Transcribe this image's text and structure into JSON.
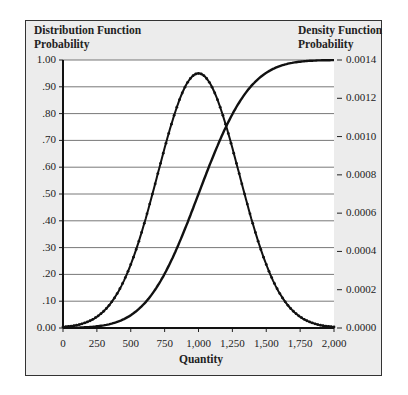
{
  "chart_data": {
    "type": "line",
    "title_left": [
      "Distribution Function",
      "Probability"
    ],
    "title_right": [
      "Density Function",
      "Probability"
    ],
    "xlabel": "Quantity",
    "x_ticks": [
      "0",
      "250",
      "500",
      "750",
      "1,000",
      "1,250",
      "1,500",
      "1,750",
      "2,000"
    ],
    "x_tick_values": [
      0,
      250,
      500,
      750,
      1000,
      1250,
      1500,
      1750,
      2000
    ],
    "xlim": [
      0,
      2000
    ],
    "y_left_ticks": [
      "0.00",
      ".10",
      ".20",
      ".30",
      ".40",
      ".50",
      ".60",
      ".70",
      ".80",
      ".90",
      "1.00"
    ],
    "y_left_lim": [
      0,
      1
    ],
    "y_right_ticks": [
      "0.0000",
      "0.0002",
      "0.0004",
      "0.0006",
      "0.0008",
      "0.0010",
      "0.0012",
      "0.0014"
    ],
    "y_right_lim": [
      0,
      0.0014
    ],
    "grid": "horizontal",
    "distribution": {
      "type": "normal",
      "mean": 1000,
      "std": 300
    },
    "series": [
      {
        "name": "Distribution Function (CDF)",
        "axis": "left",
        "x": [
          0,
          100,
          200,
          300,
          400,
          500,
          600,
          700,
          800,
          900,
          1000,
          1100,
          1200,
          1300,
          1400,
          1500,
          1600,
          1700,
          1800,
          1900,
          2000
        ],
        "values": [
          0.0004,
          0.0013,
          0.0038,
          0.0098,
          0.0228,
          0.0478,
          0.0912,
          0.1587,
          0.2525,
          0.3694,
          0.5,
          0.6306,
          0.7475,
          0.8413,
          0.9088,
          0.9522,
          0.9772,
          0.9902,
          0.9962,
          0.9987,
          0.9996
        ]
      },
      {
        "name": "Density Function (PDF)",
        "axis": "right",
        "markers": true,
        "x": [
          0,
          100,
          200,
          300,
          400,
          500,
          600,
          700,
          800,
          900,
          1000,
          1100,
          1200,
          1300,
          1400,
          1500,
          1600,
          1700,
          1800,
          1900,
          2000
        ],
        "values": [
          5.1e-06,
          1.48e-05,
          3.8e-05,
          8.73e-05,
          0.00018,
          0.0003315,
          0.0005467,
          0.0008066,
          0.0010648,
          0.0012579,
          0.0013298,
          0.0012579,
          0.0010648,
          0.0008066,
          0.0005467,
          0.0003315,
          0.00018,
          8.73e-05,
          3.8e-05,
          1.48e-05,
          5.1e-06
        ]
      }
    ]
  }
}
